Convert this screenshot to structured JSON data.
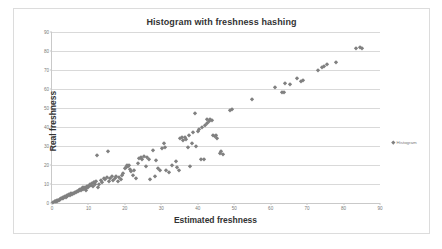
{
  "chart_data": {
    "type": "scatter",
    "title": "Histogram with freshness hashing",
    "xlabel": "Estimated freshness",
    "ylabel": "Real freshness",
    "xlim": [
      0,
      90
    ],
    "ylim": [
      0,
      90
    ],
    "xticks": [
      0,
      10,
      20,
      30,
      40,
      50,
      60,
      70,
      80,
      90
    ],
    "yticks": [
      0,
      10,
      20,
      30,
      40,
      50,
      60,
      70,
      80,
      90
    ],
    "grid": "horizontal",
    "legend_position": "right",
    "series": [
      {
        "name": "Histogram",
        "color": "#808080",
        "marker": "diamond",
        "points": [
          [
            0.4,
            0.5
          ],
          [
            0.7,
            0.8
          ],
          [
            0.9,
            1.1
          ],
          [
            1.1,
            0.9
          ],
          [
            1.3,
            1.4
          ],
          [
            1.5,
            1.2
          ],
          [
            1.7,
            1.8
          ],
          [
            1.9,
            1.6
          ],
          [
            2.1,
            2.2
          ],
          [
            2.3,
            2.0
          ],
          [
            2.5,
            2.6
          ],
          [
            2.7,
            2.4
          ],
          [
            2.9,
            3.0
          ],
          [
            3.1,
            2.8
          ],
          [
            3.4,
            3.3
          ],
          [
            3.6,
            3.6
          ],
          [
            3.8,
            3.2
          ],
          [
            4.0,
            4.0
          ],
          [
            4.2,
            3.8
          ],
          [
            4.5,
            4.3
          ],
          [
            4.7,
            4.6
          ],
          [
            5.0,
            4.4
          ],
          [
            5.2,
            5.1
          ],
          [
            5.4,
            4.9
          ],
          [
            5.7,
            5.5
          ],
          [
            6.0,
            5.3
          ],
          [
            6.2,
            6.0
          ],
          [
            6.5,
            5.8
          ],
          [
            6.8,
            6.4
          ],
          [
            7.0,
            6.2
          ],
          [
            7.3,
            7.0
          ],
          [
            7.5,
            6.7
          ],
          [
            7.8,
            7.4
          ],
          [
            8.0,
            7.1
          ],
          [
            8.2,
            8.0
          ],
          [
            8.4,
            7.6
          ],
          [
            8.6,
            8.3
          ],
          [
            8.8,
            7.9
          ],
          [
            9.0,
            8.6
          ],
          [
            9.2,
            8.1
          ],
          [
            9.4,
            6.8
          ],
          [
            9.6,
            8.8
          ],
          [
            9.8,
            9.2
          ],
          [
            10.0,
            8.4
          ],
          [
            10.3,
            9.6
          ],
          [
            10.5,
            10.1
          ],
          [
            10.7,
            9.4
          ],
          [
            11.0,
            10.4
          ],
          [
            11.2,
            9.0
          ],
          [
            11.4,
            10.8
          ],
          [
            11.6,
            11.2
          ],
          [
            11.8,
            10.0
          ],
          [
            12.0,
            11.5
          ],
          [
            12.3,
            25.5
          ],
          [
            12.6,
            8.6
          ],
          [
            13.0,
            9.8
          ],
          [
            13.4,
            12.0
          ],
          [
            13.8,
            11.0
          ],
          [
            14.2,
            13.2
          ],
          [
            14.6,
            12.6
          ],
          [
            15.0,
            13.8
          ],
          [
            15.3,
            27.5
          ],
          [
            15.6,
            11.8
          ],
          [
            16.0,
            13.0
          ],
          [
            16.4,
            14.0
          ],
          [
            16.8,
            12.2
          ],
          [
            17.2,
            13.4
          ],
          [
            17.6,
            14.4
          ],
          [
            18.0,
            11.6
          ],
          [
            18.4,
            13.6
          ],
          [
            18.8,
            12.4
          ],
          [
            19.2,
            14.8
          ],
          [
            19.6,
            16.0
          ],
          [
            20.0,
            18.4
          ],
          [
            20.3,
            19.0
          ],
          [
            20.6,
            20.2
          ],
          [
            20.9,
            19.6
          ],
          [
            21.2,
            20.0
          ],
          [
            21.5,
            18.0
          ],
          [
            21.8,
            16.6
          ],
          [
            22.1,
            15.0
          ],
          [
            22.5,
            17.2
          ],
          [
            23.0,
            13.2
          ],
          [
            23.5,
            20.8
          ],
          [
            24.0,
            23.6
          ],
          [
            24.4,
            24.2
          ],
          [
            24.8,
            23.0
          ],
          [
            25.2,
            24.6
          ],
          [
            25.8,
            19.6
          ],
          [
            26.2,
            24.0
          ],
          [
            26.6,
            23.4
          ],
          [
            27.0,
            12.8
          ],
          [
            27.6,
            28.0
          ],
          [
            28.2,
            14.2
          ],
          [
            28.6,
            22.6
          ],
          [
            29.0,
            18.6
          ],
          [
            29.6,
            17.6
          ],
          [
            30.2,
            29.0
          ],
          [
            30.6,
            31.4
          ],
          [
            31.0,
            29.6
          ],
          [
            31.4,
            17.4
          ],
          [
            32.0,
            16.2
          ],
          [
            33.0,
            20.0
          ],
          [
            34.0,
            22.0
          ],
          [
            34.4,
            18.8
          ],
          [
            34.8,
            17.6
          ],
          [
            35.2,
            34.0
          ],
          [
            35.6,
            34.6
          ],
          [
            36.0,
            33.4
          ],
          [
            36.4,
            35.0
          ],
          [
            36.8,
            33.8
          ],
          [
            37.2,
            29.4
          ],
          [
            37.6,
            36.0
          ],
          [
            38.0,
            19.4
          ],
          [
            38.4,
            31.4
          ],
          [
            38.8,
            37.4
          ],
          [
            39.2,
            47.4
          ],
          [
            39.6,
            30.0
          ],
          [
            40.0,
            38.0
          ],
          [
            40.4,
            39.0
          ],
          [
            40.8,
            23.4
          ],
          [
            41.2,
            40.0
          ],
          [
            41.6,
            23.2
          ],
          [
            42.0,
            41.0
          ],
          [
            42.4,
            42.0
          ],
          [
            42.6,
            44.0
          ],
          [
            43.0,
            43.2
          ],
          [
            43.4,
            44.2
          ],
          [
            43.8,
            43.6
          ],
          [
            44.2,
            36.0
          ],
          [
            44.6,
            35.2
          ],
          [
            45.0,
            35.6
          ],
          [
            45.4,
            34.4
          ],
          [
            46.0,
            26.4
          ],
          [
            46.4,
            27.2
          ],
          [
            46.8,
            26.0
          ],
          [
            48.8,
            48.8
          ],
          [
            49.4,
            49.4
          ],
          [
            55.0,
            55.0
          ],
          [
            61.2,
            61.2
          ],
          [
            63.2,
            58.2
          ],
          [
            63.6,
            58.6
          ],
          [
            64.0,
            63.4
          ],
          [
            65.4,
            62.6
          ],
          [
            67.2,
            66.0
          ],
          [
            68.2,
            64.4
          ],
          [
            68.8,
            64.8
          ],
          [
            73.0,
            70.2
          ],
          [
            74.2,
            71.6
          ],
          [
            74.6,
            72.2
          ],
          [
            75.4,
            73.0
          ],
          [
            78.0,
            74.2
          ],
          [
            83.4,
            81.6
          ],
          [
            84.6,
            82.0
          ],
          [
            85.0,
            81.8
          ]
        ]
      }
    ]
  },
  "legend": {
    "label": "Histogram"
  }
}
